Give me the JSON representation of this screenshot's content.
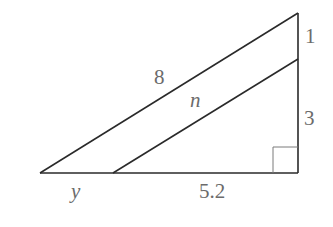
{
  "diagram": {
    "type": "right-triangle-with-parallel-segment",
    "labels": {
      "hypotenuse_outer": "8",
      "segment_inner": "n",
      "right_top": "1",
      "right_bottom": "3",
      "base_left": "y",
      "base_right": "5.2"
    },
    "colors": {
      "line": "#2a2a2a",
      "label": "#6b6b6b",
      "right_angle": "#7a7a7a"
    }
  }
}
